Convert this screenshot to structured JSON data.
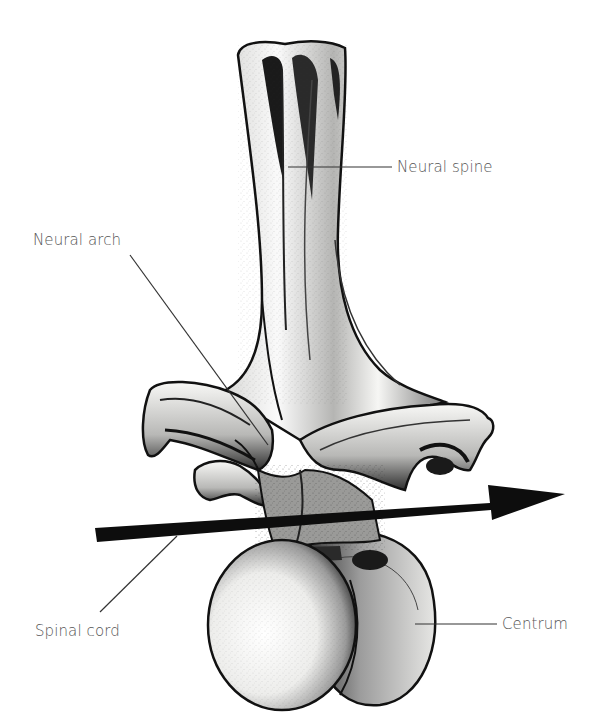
{
  "figure": {
    "colors": {
      "ink": "#111111",
      "label_text": "#555555",
      "leader_line": "#333333",
      "background": "#ffffff",
      "bone_fill": "#f4f4f2",
      "shade": "#8a8a8a"
    }
  },
  "labels": {
    "neural_spine": "Neural spine",
    "neural_arch": "Neural arch",
    "spinal_cord": "Spinal cord",
    "centrum": "Centrum"
  },
  "arrow": {
    "meaning": "Spinal cord path through neural canal",
    "direction": "right"
  }
}
